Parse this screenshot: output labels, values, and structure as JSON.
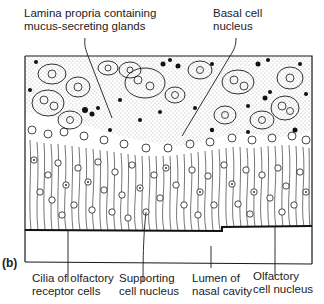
{
  "figure": {
    "panel_label": "(b)",
    "top_labels": [
      {
        "id": "lamina-propria",
        "lines": [
          "Lamina propria containing",
          "mucus-secreting glands"
        ]
      },
      {
        "id": "basal-cell-nucleus",
        "lines": [
          "Basal cell",
          "nucleus"
        ]
      }
    ],
    "bottom_labels": [
      {
        "id": "cilia",
        "lines": [
          "Cilia of olfactory",
          "receptor cells"
        ]
      },
      {
        "id": "supporting-cell-nucleus",
        "lines": [
          "Supporting",
          "cell nucleus"
        ]
      },
      {
        "id": "lumen",
        "lines": [
          "Lumen of",
          "nasal cavity"
        ]
      },
      {
        "id": "olfactory-cell-nucleus",
        "lines": [
          "Olfactory",
          "cell nucleus"
        ]
      }
    ],
    "colors": {
      "ink": "#1a1a1a",
      "background": "#ffffff",
      "stipple": "#555555"
    }
  }
}
